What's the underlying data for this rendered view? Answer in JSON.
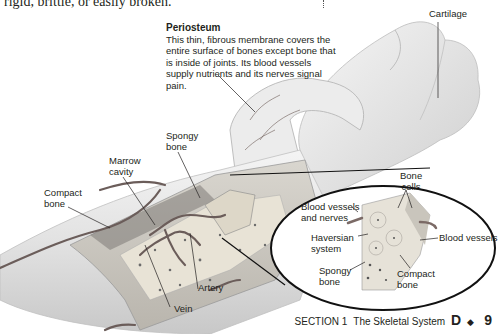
{
  "page": {
    "body_text_fragment": "rigid, brittle, or easily broken."
  },
  "figure": {
    "caption": {
      "title": "Periosteum",
      "text": "This thin, fibrous membrane covers the entire surface of bones except bone that is inside of joints. Its blood vessels supply nutrients and its nerves signal pain."
    },
    "labels": {
      "cartilage": "Cartilage",
      "spongy_bone": [
        "Spongy",
        "bone"
      ],
      "marrow_cavity": [
        "Marrow",
        "cavity"
      ],
      "compact_bone": [
        "Compact",
        "bone"
      ],
      "artery": "Artery",
      "vein": "Vein"
    },
    "inset_labels": {
      "bone_cells": [
        "Bone",
        "cells"
      ],
      "blood_vessels_and_nerves": [
        "Blood vessels",
        "and nerves"
      ],
      "haversian_system": [
        "Haversian",
        "system"
      ],
      "blood_vessels": "Blood vessels",
      "spongy_bone": [
        "Spongy",
        "bone"
      ],
      "compact_bone": [
        "Compact",
        "bone"
      ]
    }
  },
  "footer": {
    "section": "SECTION 1",
    "title": "The Skeletal System",
    "unit": "D",
    "separator": "◆",
    "page_number": "9"
  }
}
